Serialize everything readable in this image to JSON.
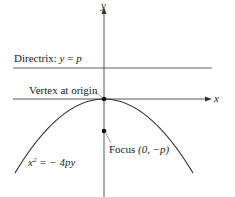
{
  "diagram": {
    "axes": {
      "x_label": "x",
      "y_label": "y"
    },
    "directrix": {
      "prefix": "Directrix: ",
      "var": "y",
      "eq": " = ",
      "val": "p"
    },
    "vertex": {
      "label": "Vertex at origin"
    },
    "focus": {
      "label_prefix": "Focus ",
      "coords": "(0, −p)"
    },
    "equation": {
      "lhs": "x",
      "exp": "2",
      "rhs": " = − 4py"
    },
    "colors": {
      "curve": "#333333",
      "axes": "#444444",
      "directrix": "#555555"
    }
  }
}
